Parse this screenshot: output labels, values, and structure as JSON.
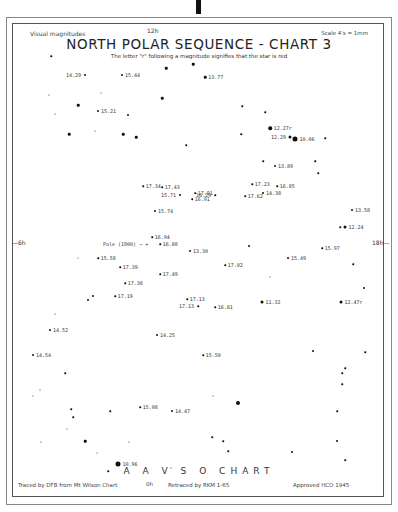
{
  "header": {
    "left": "Visual magnitudes",
    "ra_top": "12h",
    "right": "Scale 4's = 1mm",
    "title": "NORTH POLAR SEQUENCE - CHART 3",
    "subtitle": "The letter \"r\" following a magnitude signifies that the star is red"
  },
  "axes": {
    "ra_left": "6h",
    "ra_right": "18h",
    "ra_bottom": "0h"
  },
  "footer": {
    "title": "A A V S O  CHART",
    "traced": "Traced by DFB from Mt Wilson Chart",
    "ra_bottom": "0h",
    "retraced": "Retraced by RKM 1-65",
    "approved": "Approved HCO  1945"
  },
  "pole_label": "Pole (1900) → +",
  "labeled_stars": [
    {
      "x": 85,
      "y": 75,
      "size": 2,
      "label": "14.29",
      "side": "left"
    },
    {
      "x": 122,
      "y": 75,
      "size": 2,
      "label": "15.44",
      "side": "right"
    },
    {
      "x": 205,
      "y": 77,
      "size": 2.5,
      "label": "13.77",
      "side": "right"
    },
    {
      "x": 98,
      "y": 111,
      "size": 2,
      "label": "15.21",
      "side": "right"
    },
    {
      "x": 270,
      "y": 128,
      "size": 3.5,
      "label": "12.27r",
      "side": "right"
    },
    {
      "x": 295,
      "y": 139,
      "size": 5,
      "label": "10.06",
      "side": "right"
    },
    {
      "x": 290,
      "y": 137,
      "size": 3,
      "label": "12.29",
      "side": "left"
    },
    {
      "x": 275,
      "y": 166,
      "size": 2,
      "label": "13.89",
      "side": "right"
    },
    {
      "x": 143,
      "y": 186,
      "size": 1.5,
      "label": "17.34",
      "side": "right"
    },
    {
      "x": 162,
      "y": 187,
      "size": 1.5,
      "label": "17.43",
      "side": "right"
    },
    {
      "x": 252,
      "y": 184,
      "size": 1.5,
      "label": "17.23",
      "side": "right"
    },
    {
      "x": 277,
      "y": 186,
      "size": 1.5,
      "label": "16.85",
      "side": "right"
    },
    {
      "x": 180,
      "y": 195,
      "size": 2,
      "label": "15.71",
      "side": "left"
    },
    {
      "x": 195,
      "y": 193,
      "size": 1.5,
      "label": "17.91",
      "side": "right"
    },
    {
      "x": 192,
      "y": 199,
      "size": 1.5,
      "label": "16.91",
      "side": "right"
    },
    {
      "x": 215,
      "y": 195,
      "size": 1.5,
      "label": "16.29",
      "side": "left"
    },
    {
      "x": 245,
      "y": 196,
      "size": 1.5,
      "label": "17.62",
      "side": "right"
    },
    {
      "x": 263,
      "y": 193,
      "size": 2,
      "label": "14.38",
      "side": "right"
    },
    {
      "x": 155,
      "y": 211,
      "size": 2,
      "label": "15.74",
      "side": "right"
    },
    {
      "x": 352,
      "y": 210,
      "size": 2,
      "label": "13.58",
      "side": "right"
    },
    {
      "x": 345,
      "y": 227,
      "size": 3,
      "label": "12.24",
      "side": "right"
    },
    {
      "x": 152,
      "y": 237,
      "size": 1.5,
      "label": "16.94",
      "side": "right"
    },
    {
      "x": 160,
      "y": 244,
      "size": 1.5,
      "label": "16.80",
      "side": "right"
    },
    {
      "x": 190,
      "y": 251,
      "size": 2,
      "label": "13.30",
      "side": "right"
    },
    {
      "x": 322,
      "y": 248,
      "size": 1.5,
      "label": "15.97",
      "side": "right"
    },
    {
      "x": 98,
      "y": 258,
      "size": 1.5,
      "label": "15.58",
      "side": "right"
    },
    {
      "x": 288,
      "y": 258,
      "size": 2,
      "label": "15.49",
      "side": "right"
    },
    {
      "x": 225,
      "y": 265,
      "size": 1.5,
      "label": "17.02",
      "side": "right"
    },
    {
      "x": 120,
      "y": 267,
      "size": 1.5,
      "label": "17.39",
      "side": "right"
    },
    {
      "x": 160,
      "y": 274,
      "size": 1.5,
      "label": "17.49",
      "side": "right"
    },
    {
      "x": 125,
      "y": 283,
      "size": 1.5,
      "label": "17.38",
      "side": "right"
    },
    {
      "x": 115,
      "y": 296,
      "size": 1.5,
      "label": "17.19",
      "side": "right"
    },
    {
      "x": 187,
      "y": 299,
      "size": 1.5,
      "label": "17.13",
      "side": "right"
    },
    {
      "x": 198,
      "y": 306,
      "size": 1.5,
      "label": "17.13",
      "side": "left"
    },
    {
      "x": 215,
      "y": 307,
      "size": 1.5,
      "label": "16.81",
      "side": "right"
    },
    {
      "x": 262,
      "y": 302,
      "size": 3,
      "label": "11.32",
      "side": "right"
    },
    {
      "x": 341,
      "y": 302,
      "size": 3,
      "label": "12.47r",
      "side": "right"
    },
    {
      "x": 50,
      "y": 330,
      "size": 2,
      "label": "14.52",
      "side": "right"
    },
    {
      "x": 157,
      "y": 335,
      "size": 2,
      "label": "14.25",
      "side": "right"
    },
    {
      "x": 33,
      "y": 355,
      "size": 2,
      "label": "14.54",
      "side": "right"
    },
    {
      "x": 203,
      "y": 355,
      "size": 1.5,
      "label": "15.50",
      "side": "right"
    },
    {
      "x": 140,
      "y": 407,
      "size": 1.5,
      "label": "15.08",
      "side": "right"
    },
    {
      "x": 172,
      "y": 411,
      "size": 2,
      "label": "14.47",
      "side": "right"
    },
    {
      "x": 118,
      "y": 464,
      "size": 5,
      "label": "10.96",
      "side": "right"
    }
  ],
  "unlabeled_stars": [
    {
      "x": 51,
      "y": 56,
      "size": 1.5
    },
    {
      "x": 166,
      "y": 68,
      "size": 2.5
    },
    {
      "x": 193,
      "y": 64,
      "size": 2.5
    },
    {
      "x": 162,
      "y": 98,
      "size": 2.5
    },
    {
      "x": 101,
      "y": 93,
      "size": 1
    },
    {
      "x": 49,
      "y": 95,
      "size": 1
    },
    {
      "x": 78,
      "y": 105,
      "size": 2.5
    },
    {
      "x": 128,
      "y": 115,
      "size": 2
    },
    {
      "x": 55,
      "y": 114,
      "size": 1
    },
    {
      "x": 69,
      "y": 134,
      "size": 2.5
    },
    {
      "x": 95,
      "y": 131,
      "size": 1
    },
    {
      "x": 123,
      "y": 134,
      "size": 2.5
    },
    {
      "x": 136,
      "y": 137,
      "size": 2.5
    },
    {
      "x": 186,
      "y": 145,
      "size": 1.5
    },
    {
      "x": 241,
      "y": 134,
      "size": 1.5
    },
    {
      "x": 242,
      "y": 106,
      "size": 1.5
    },
    {
      "x": 265,
      "y": 112,
      "size": 1.5
    },
    {
      "x": 325,
      "y": 138,
      "size": 1.5
    },
    {
      "x": 315,
      "y": 161,
      "size": 1.5
    },
    {
      "x": 318,
      "y": 173,
      "size": 1.5
    },
    {
      "x": 263,
      "y": 161,
      "size": 1.5
    },
    {
      "x": 340,
      "y": 227,
      "size": 1.5
    },
    {
      "x": 78,
      "y": 258,
      "size": 1
    },
    {
      "x": 249,
      "y": 246,
      "size": 2
    },
    {
      "x": 270,
      "y": 277,
      "size": 1
    },
    {
      "x": 353,
      "y": 264,
      "size": 1.5
    },
    {
      "x": 364,
      "y": 288,
      "size": 2
    },
    {
      "x": 93,
      "y": 296,
      "size": 2
    },
    {
      "x": 88,
      "y": 300,
      "size": 2
    },
    {
      "x": 55,
      "y": 314,
      "size": 1
    },
    {
      "x": 65,
      "y": 373,
      "size": 1.5
    },
    {
      "x": 40,
      "y": 390,
      "size": 1
    },
    {
      "x": 33,
      "y": 396,
      "size": 1
    },
    {
      "x": 213,
      "y": 396,
      "size": 1
    },
    {
      "x": 313,
      "y": 351,
      "size": 2
    },
    {
      "x": 365,
      "y": 352,
      "size": 1.5
    },
    {
      "x": 345,
      "y": 368,
      "size": 1.5
    },
    {
      "x": 342,
      "y": 373,
      "size": 1.5
    },
    {
      "x": 342,
      "y": 384,
      "size": 1.5
    },
    {
      "x": 238,
      "y": 403,
      "size": 4
    },
    {
      "x": 71,
      "y": 409,
      "size": 1.5
    },
    {
      "x": 73,
      "y": 417,
      "size": 1.5
    },
    {
      "x": 110,
      "y": 411,
      "size": 1.5
    },
    {
      "x": 67,
      "y": 429,
      "size": 1
    },
    {
      "x": 41,
      "y": 442,
      "size": 1
    },
    {
      "x": 85,
      "y": 441,
      "size": 2.5
    },
    {
      "x": 129,
      "y": 442,
      "size": 1
    },
    {
      "x": 97,
      "y": 453,
      "size": 1
    },
    {
      "x": 108,
      "y": 471,
      "size": 1.5
    },
    {
      "x": 212,
      "y": 437,
      "size": 1.5
    },
    {
      "x": 223,
      "y": 441,
      "size": 1.5
    },
    {
      "x": 228,
      "y": 451,
      "size": 1.5
    },
    {
      "x": 292,
      "y": 452,
      "size": 2
    },
    {
      "x": 337,
      "y": 411,
      "size": 1.5
    },
    {
      "x": 337,
      "y": 441,
      "size": 2
    },
    {
      "x": 345,
      "y": 460,
      "size": 1.5
    },
    {
      "x": 171,
      "y": 468,
      "size": 1
    }
  ]
}
